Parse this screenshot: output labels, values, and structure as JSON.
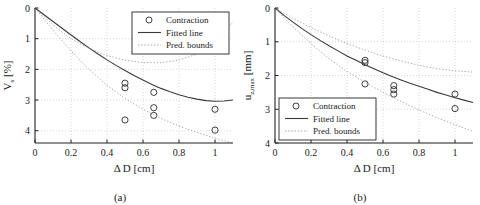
{
  "figure": {
    "panels": [
      {
        "id": "a",
        "caption": "(a)",
        "legend_position": "top-right"
      },
      {
        "id": "b",
        "caption": "(b)",
        "legend_position": "bottom-left"
      }
    ]
  },
  "chart_data": [
    {
      "type": "scatter",
      "title": "",
      "panel": "(a)",
      "xlabel": "Δ D [cm]",
      "ylabel_main": "V",
      "ylabel_sub": "s",
      "ylabel_unit": " [%]",
      "ylabel": "V_s [%]",
      "xlim": [
        0,
        1.1
      ],
      "ylim": [
        0,
        4.4
      ],
      "y_inverted": true,
      "grid": true,
      "xticks": [
        0,
        0.2,
        0.4,
        0.6,
        0.8,
        1
      ],
      "xticklabels": [
        "0",
        "0.2",
        "0.4",
        "0.6",
        "0.8",
        "1"
      ],
      "yticks": [
        0,
        1,
        2,
        3,
        4
      ],
      "yticklabels": [
        "0",
        "1",
        "2",
        "3",
        "4"
      ],
      "legend": [
        {
          "label": "Contraction",
          "marker": "circle"
        },
        {
          "label": "Fitted line",
          "marker": "solid-line"
        },
        {
          "label": "Pred. bounds",
          "marker": "dotted-line"
        }
      ],
      "series": [
        {
          "name": "Contraction",
          "marker": "circle",
          "x": [
            0.5,
            0.5,
            0.5,
            0.66,
            0.66,
            0.66,
            1.0,
            1.0
          ],
          "y": [
            2.45,
            2.6,
            3.65,
            2.75,
            3.25,
            3.5,
            3.3,
            3.98
          ]
        },
        {
          "name": "Fitted line",
          "style": "solid",
          "x": [
            0,
            0.05,
            0.1,
            0.15,
            0.2,
            0.25,
            0.3,
            0.35,
            0.4,
            0.45,
            0.5,
            0.55,
            0.6,
            0.65,
            0.7,
            0.75,
            0.8,
            0.85,
            0.9,
            0.95,
            1.0,
            1.05,
            1.1
          ],
          "y": [
            0.0,
            0.22,
            0.44,
            0.66,
            0.88,
            1.09,
            1.3,
            1.5,
            1.69,
            1.87,
            2.04,
            2.2,
            2.35,
            2.49,
            2.62,
            2.73,
            2.83,
            2.91,
            2.97,
            3.02,
            3.04,
            3.03,
            3.0
          ]
        },
        {
          "name": "Pred. bounds upper",
          "style": "dotted",
          "x": [
            0,
            0.1,
            0.2,
            0.3,
            0.4,
            0.5,
            0.6,
            0.7,
            0.8,
            0.9,
            1.0,
            1.1
          ],
          "y": [
            0.0,
            0.55,
            1.0,
            1.32,
            1.55,
            1.7,
            1.78,
            1.78,
            1.7,
            1.5,
            1.1,
            0.45
          ]
        },
        {
          "name": "Pred. bounds lower",
          "style": "dotted",
          "x": [
            0,
            0.1,
            0.2,
            0.3,
            0.4,
            0.5,
            0.6,
            0.7,
            0.8,
            0.9,
            1.0,
            1.1
          ],
          "y": [
            0.0,
            0.72,
            1.4,
            2.0,
            2.52,
            2.95,
            3.3,
            3.6,
            3.85,
            4.05,
            4.25,
            4.4
          ]
        }
      ]
    },
    {
      "type": "scatter",
      "title": "",
      "panel": "(b)",
      "xlabel": "Δ D [cm]",
      "ylabel_main": "u",
      "ylabel_sub": "z,max",
      "ylabel_unit": " [mm]",
      "ylabel": "u_z,max [mm]",
      "xlim": [
        0,
        1.1
      ],
      "ylim": [
        0,
        4.0
      ],
      "y_inverted": true,
      "grid": true,
      "xticks": [
        0,
        0.2,
        0.4,
        0.6,
        0.8,
        1
      ],
      "xticklabels": [
        "0",
        "0.2",
        "0.4",
        "0.6",
        "0.8",
        "1"
      ],
      "yticks": [
        0,
        1,
        2,
        3,
        4
      ],
      "yticklabels": [
        "0",
        "1",
        "2",
        "3",
        "4"
      ],
      "legend": [
        {
          "label": "Contraction",
          "marker": "circle"
        },
        {
          "label": "Fitted line",
          "marker": "solid-line"
        },
        {
          "label": "Pred. bounds",
          "marker": "dotted-line"
        }
      ],
      "series": [
        {
          "name": "Contraction",
          "marker": "circle",
          "x": [
            0.5,
            0.5,
            0.5,
            0.66,
            0.66,
            0.66,
            1.0,
            1.0
          ],
          "y": [
            1.55,
            1.62,
            2.25,
            2.3,
            2.42,
            2.55,
            2.55,
            2.98
          ]
        },
        {
          "name": "Fitted line",
          "style": "solid",
          "x": [
            0,
            0.05,
            0.1,
            0.15,
            0.2,
            0.25,
            0.3,
            0.35,
            0.4,
            0.45,
            0.5,
            0.55,
            0.6,
            0.65,
            0.7,
            0.75,
            0.8,
            0.85,
            0.9,
            0.95,
            1.0,
            1.05,
            1.1
          ],
          "y": [
            0.0,
            0.22,
            0.42,
            0.61,
            0.79,
            0.96,
            1.12,
            1.27,
            1.42,
            1.55,
            1.68,
            1.8,
            1.92,
            2.03,
            2.13,
            2.23,
            2.32,
            2.41,
            2.5,
            2.58,
            2.66,
            2.73,
            2.8
          ]
        },
        {
          "name": "Pred. bounds upper",
          "style": "dotted",
          "x": [
            0,
            0.1,
            0.2,
            0.3,
            0.4,
            0.5,
            0.6,
            0.7,
            0.8,
            0.9,
            1.0,
            1.1
          ],
          "y": [
            0.0,
            0.3,
            0.58,
            0.83,
            1.05,
            1.25,
            1.42,
            1.57,
            1.7,
            1.8,
            1.86,
            1.9
          ]
        },
        {
          "name": "Pred. bounds lower",
          "style": "dotted",
          "x": [
            0,
            0.1,
            0.2,
            0.3,
            0.4,
            0.5,
            0.6,
            0.7,
            0.8,
            0.9,
            1.0,
            1.1
          ],
          "y": [
            0.0,
            0.56,
            1.06,
            1.5,
            1.88,
            2.2,
            2.5,
            2.77,
            3.02,
            3.25,
            3.46,
            3.65
          ]
        }
      ]
    }
  ]
}
